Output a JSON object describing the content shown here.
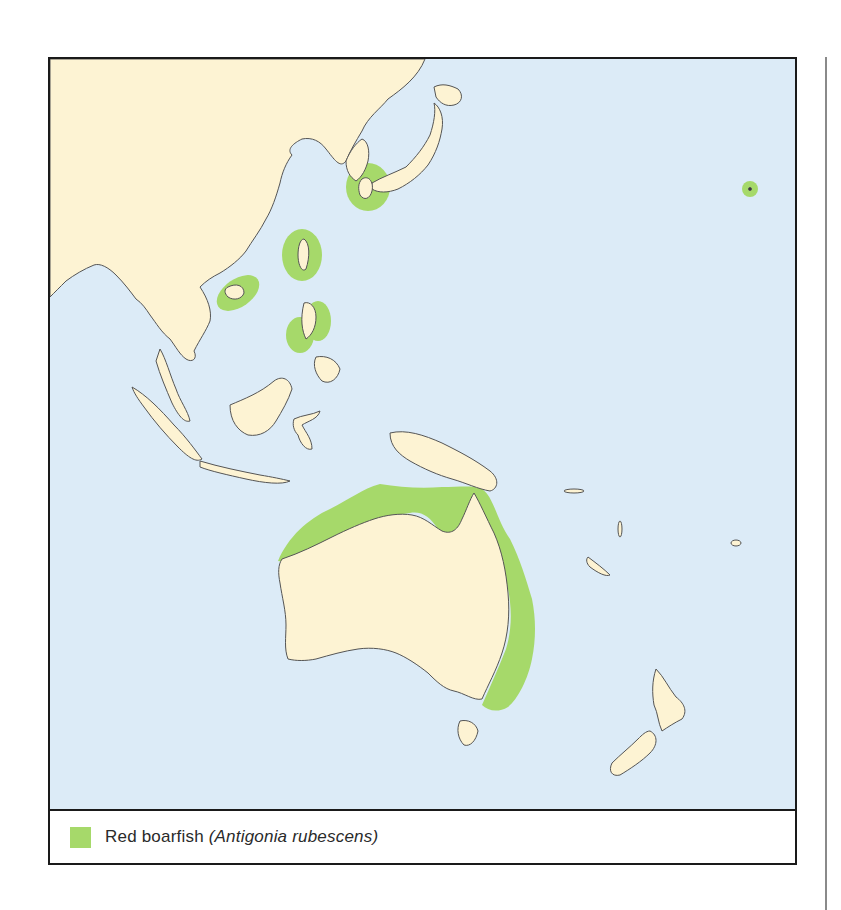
{
  "map": {
    "region": "Western Pacific, Southeast Asia and Australasia",
    "colors": {
      "ocean": "#dcebf7",
      "land": "#fdf3d3",
      "coast": "#555555",
      "range": "#a6d96a",
      "frame": "#1a1a1a"
    },
    "range_areas": [
      "Southern Japan / Korea Strait",
      "Taiwan",
      "Hainan / Gulf of Tonkin",
      "Philippines",
      "Northern Australia coast",
      "Eastern Australia coast",
      "Hawaiian Islands (isolated point)"
    ]
  },
  "legend": {
    "swatch_color": "#a6d96a",
    "common_name": "Red boarfish ",
    "scientific_name": "(Antigonia rubescens)"
  }
}
